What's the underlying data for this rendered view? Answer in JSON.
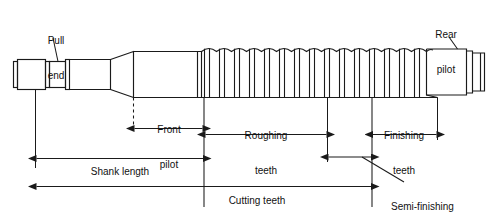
{
  "diagram": {
    "type": "engineering-line-drawing",
    "line_color": "#1a1a1a",
    "background_color": "#ffffff",
    "callouts": [
      {
        "id": "pull-end",
        "label_line1": "Pull",
        "label_line2": "end",
        "text": "Pull end"
      },
      {
        "id": "rear-pilot",
        "label_line1": "Rear",
        "label_line2": "pilot",
        "text": "Rear pilot"
      }
    ],
    "dimensions": [
      {
        "id": "front-pilot",
        "label_line1": "Front",
        "label_line2": "pilot",
        "text": "Front pilot"
      },
      {
        "id": "roughing-teeth",
        "label_line1": "Roughing",
        "label_line2": "teeth",
        "text": "Roughing teeth"
      },
      {
        "id": "finishing-teeth",
        "label_line1": "Finishing",
        "label_line2": "teeth",
        "text": "Finishing teeth"
      },
      {
        "id": "shank-length",
        "label_line1": "Shank length",
        "label_line2": "",
        "text": "Shank length"
      },
      {
        "id": "cutting-teeth",
        "label_line1": "Cutting teeth",
        "label_line2": "",
        "text": "Cutting teeth"
      },
      {
        "id": "semi-finishing-teeth",
        "label_line1": "Semi-finishing",
        "label_line2": "teeth",
        "text": "Semi-finishing teeth"
      }
    ]
  }
}
